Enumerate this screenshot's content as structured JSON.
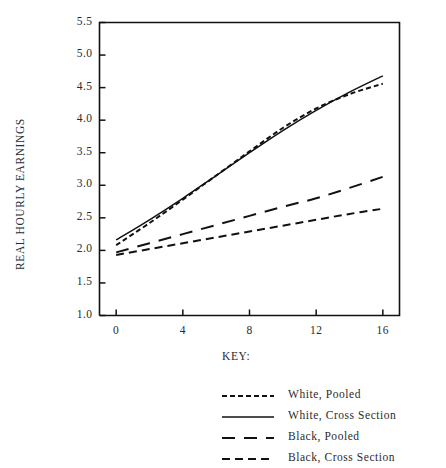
{
  "chart_data": {
    "type": "line",
    "title": "",
    "xlabel": "",
    "ylabel": "REAL HOURLY EARNINGS",
    "xlim": [
      -1,
      17
    ],
    "ylim": [
      1.0,
      5.5
    ],
    "grid": false,
    "legend_position": "below-right",
    "legend_title": "KEY:",
    "xticks": [
      "0",
      "4",
      "8",
      "12",
      "16"
    ],
    "xtick_values": [
      0,
      4,
      8,
      12,
      16
    ],
    "yticks": [
      "1.0",
      "1.5",
      "2.0",
      "2.5",
      "3.0",
      "3.5",
      "4.0",
      "4.5",
      "5.0",
      "5.5"
    ],
    "ytick_values": [
      1.0,
      1.5,
      2.0,
      2.5,
      3.0,
      3.5,
      4.0,
      4.5,
      5.0,
      5.5
    ],
    "x": [
      0,
      2,
      4,
      6,
      8,
      10,
      12,
      14,
      16
    ],
    "series": [
      {
        "name": "White, Pooled",
        "style": "fine-dashed",
        "color": "#111111",
        "values": [
          2.08,
          2.42,
          2.78,
          3.15,
          3.52,
          3.88,
          4.18,
          4.4,
          4.56
        ]
      },
      {
        "name": "White, Cross Section",
        "style": "solid",
        "color": "#111111",
        "values": [
          2.16,
          2.47,
          2.8,
          3.15,
          3.5,
          3.84,
          4.15,
          4.43,
          4.68
        ]
      },
      {
        "name": "Black, Pooled",
        "style": "long-dashed",
        "color": "#111111",
        "values": [
          1.97,
          2.11,
          2.25,
          2.39,
          2.53,
          2.67,
          2.8,
          2.96,
          3.13
        ]
      },
      {
        "name": "Black, Cross Section",
        "style": "medium-dashed",
        "color": "#111111",
        "values": [
          1.93,
          2.02,
          2.11,
          2.2,
          2.29,
          2.38,
          2.47,
          2.56,
          2.64
        ]
      }
    ]
  },
  "axes": {
    "y_title": "REAL HOURLY EARNINGS"
  },
  "key": {
    "label": "KEY:",
    "entries": [
      {
        "label": "White, Pooled"
      },
      {
        "label": "White, Cross Section"
      },
      {
        "label": "Black, Pooled"
      },
      {
        "label": "Black, Cross Section"
      }
    ]
  }
}
